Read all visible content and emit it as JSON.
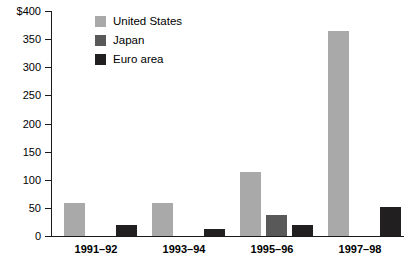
{
  "chart_data": {
    "type": "bar",
    "title": "",
    "xlabel": "",
    "ylabel": "",
    "categories": [
      "1991–92",
      "1993–94",
      "1995–96",
      "1997–98"
    ],
    "series": [
      {
        "name": "United States",
        "color": "#a9a9a9",
        "values": [
          58,
          58,
          114,
          365
        ]
      },
      {
        "name": "Japan",
        "color": "#595959",
        "values": [
          0,
          0,
          37,
          0
        ]
      },
      {
        "name": "Euro area",
        "color": "#211f1f",
        "values": [
          19,
          12,
          20,
          52
        ]
      }
    ],
    "ylim": [
      0,
      400
    ],
    "yticks": [
      0,
      50,
      100,
      150,
      200,
      250,
      300,
      350,
      400
    ],
    "ytick_labels": [
      "0",
      "50",
      "100",
      "150",
      "200",
      "250",
      "300",
      "350",
      "$400"
    ],
    "grid": false,
    "legend_position": "top-left-inside",
    "currency_symbol": "$"
  }
}
